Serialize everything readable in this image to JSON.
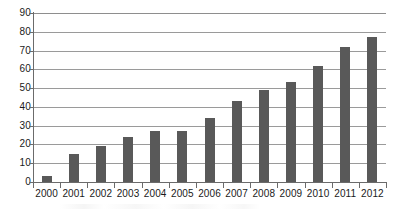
{
  "chart_data": {
    "type": "bar",
    "title": "",
    "subtitle": "",
    "xlabel": "",
    "ylabel": "",
    "categories": [
      "2000",
      "2001",
      "2002",
      "2003",
      "2004",
      "2005",
      "2006",
      "2007",
      "2008",
      "2009",
      "2010",
      "2011",
      "2012"
    ],
    "values": [
      3,
      15,
      19,
      24,
      27,
      27,
      34,
      43,
      49,
      53,
      62,
      72,
      77
    ],
    "series": [
      {
        "name": "",
        "values": [
          3,
          15,
          19,
          24,
          27,
          27,
          34,
          43,
          49,
          53,
          62,
          72,
          77
        ]
      }
    ],
    "ylim": [
      0,
      90
    ],
    "ytick_values": [
      0,
      10,
      20,
      30,
      40,
      50,
      60,
      70,
      80,
      90
    ],
    "ytick_labels": [
      "0",
      "10",
      "20",
      "30",
      "40",
      "50",
      "60",
      "70",
      "80",
      "90"
    ],
    "grid": true,
    "grid_axis": "y",
    "legend": false,
    "legend_position": "none",
    "bar_color": "#595959",
    "gridline_color": "#9a9a9a",
    "axis_color": "#6b6b6b",
    "background_color": "#ffffff",
    "text_color": "#1a1a1a",
    "bar_width_ratio": 0.38,
    "annotations": []
  }
}
